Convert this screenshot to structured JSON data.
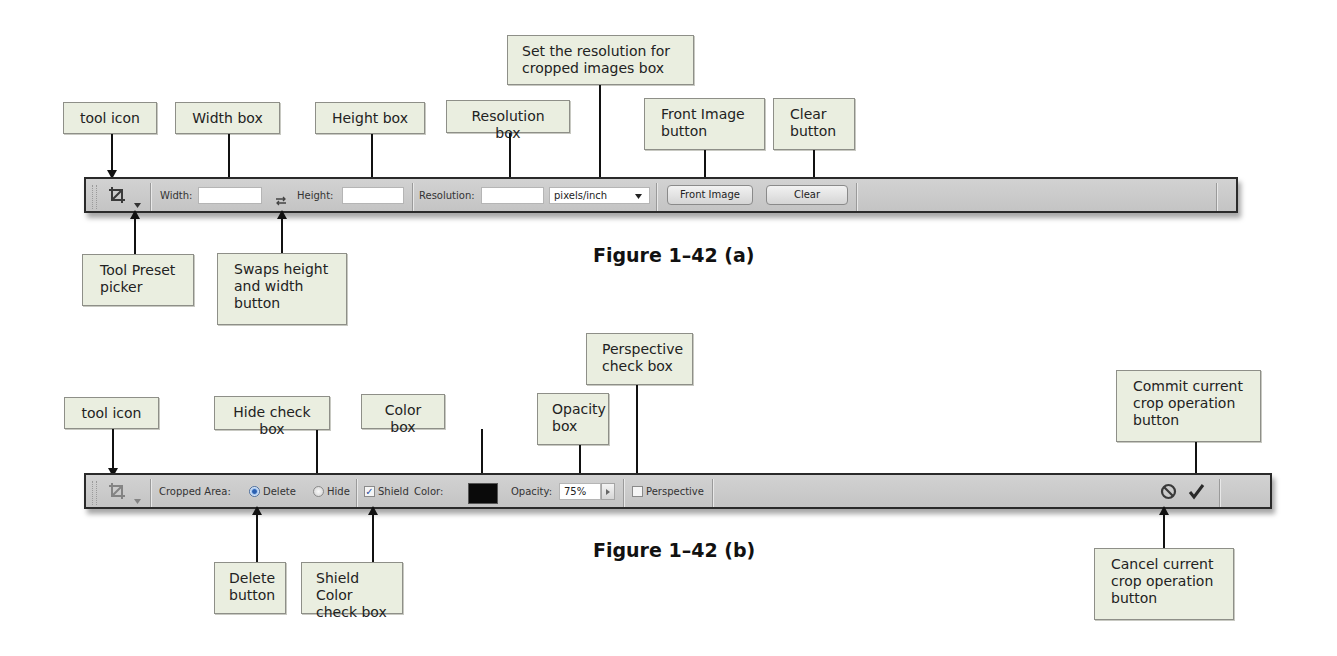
{
  "figure_a": {
    "caption": "Figure 1–42 (a)",
    "toolbar": {
      "tool_icon": "crop-icon",
      "preset_picker_icon": "chevron-down-icon",
      "width_label": "Width:",
      "width_value": "",
      "swap_icon": "swap-arrows-icon",
      "height_label": "Height:",
      "height_value": "",
      "resolution_label": "Resolution:",
      "resolution_value": "",
      "resolution_unit": "pixels/inch",
      "front_image_label": "Front Image",
      "clear_label": "Clear"
    },
    "callouts": {
      "tool_icon": "tool icon",
      "width_box": "Width box",
      "height_box": "Height box",
      "resolution_box": "Resolution box",
      "set_resolution_line1": "Set the resolution for",
      "set_resolution_line2": "cropped images box",
      "front_image_line1": "Front Image",
      "front_image_line2": "button",
      "clear_line1": "Clear",
      "clear_line2": "button",
      "tool_preset_line1": "Tool Preset",
      "tool_preset_line2": "picker",
      "swap_line1": "Swaps height",
      "swap_line2": "and width",
      "swap_line3": "button"
    }
  },
  "figure_b": {
    "caption": "Figure 1–42 (b)",
    "toolbar": {
      "tool_icon": "crop-icon",
      "preset_picker_icon": "chevron-down-icon",
      "cropped_area_label": "Cropped Area:",
      "delete_label": "Delete",
      "delete_selected": true,
      "hide_label": "Hide",
      "hide_selected": false,
      "shield_label": "Shield",
      "shield_checked": true,
      "color_label": "Color:",
      "color_value": "#000000",
      "opacity_label": "Opacity:",
      "opacity_value": "75%",
      "perspective_label": "Perspective",
      "perspective_checked": false,
      "cancel_icon": "cancel-icon",
      "commit_icon": "checkmark-icon"
    },
    "callouts": {
      "tool_icon": "tool icon",
      "hide_check_box": "Hide check box",
      "color_box": "Color box",
      "opacity_line1": "Opacity",
      "opacity_line2": "box",
      "perspective_line1": "Perspective",
      "perspective_line2": "check box",
      "commit_line1": "Commit current",
      "commit_line2": "crop operation",
      "commit_line3": "button",
      "delete_line1": "Delete",
      "delete_line2": "button",
      "shield_line1": "Shield Color",
      "shield_line2": "check box",
      "cancel_line1": "Cancel current",
      "cancel_line2": "crop operation",
      "cancel_line3": "button"
    }
  }
}
